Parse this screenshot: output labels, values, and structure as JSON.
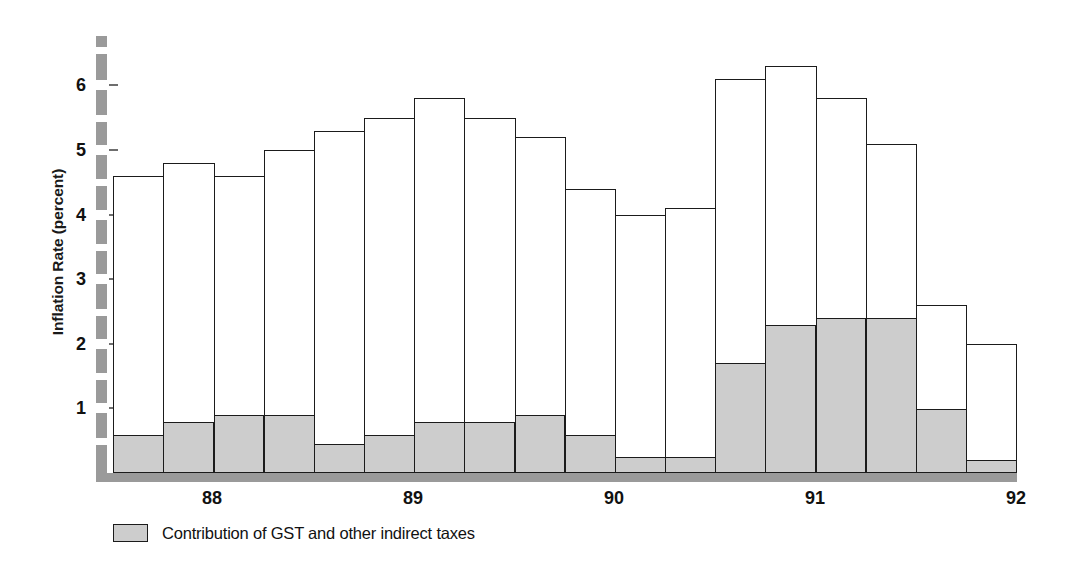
{
  "chart_data": {
    "type": "bar",
    "title": "",
    "subtitle": "",
    "xlabel": "",
    "ylabel": "Inflation Rate (percent)",
    "ylim": [
      0,
      6.75
    ],
    "yticks": [
      1,
      2,
      3,
      4,
      5,
      6
    ],
    "ytick_labels": [
      "1",
      "2",
      "3",
      "4",
      "5",
      "6"
    ],
    "xtick_labels": [
      "88",
      "89",
      "90",
      "91",
      "92"
    ],
    "xtick_positions": [
      212,
      413,
      614,
      815,
      1016
    ],
    "grid": false,
    "legend_position": "below-left",
    "stacked": true,
    "categories": [
      "1988Q1",
      "1988Q2",
      "1988Q3",
      "1988Q4",
      "1989Q1",
      "1989Q2",
      "1989Q3",
      "1989Q4",
      "1990Q1",
      "1990Q2",
      "1990Q3",
      "1990Q4",
      "1991Q1",
      "1991Q2",
      "1991Q3",
      "1991Q4",
      "1992Q1",
      "1992Q2"
    ],
    "series": [
      {
        "name": "Total inflation rate",
        "values": [
          4.6,
          4.8,
          4.6,
          5.0,
          5.3,
          5.5,
          5.8,
          5.5,
          5.2,
          4.4,
          4.0,
          4.1,
          6.1,
          6.3,
          5.8,
          5.1,
          2.6,
          2.0
        ],
        "color": "#ffffff",
        "edge_color": "#1b1b1b"
      },
      {
        "name": "Contribution of GST and other indirect taxes",
        "values": [
          0.6,
          0.8,
          0.9,
          0.9,
          0.45,
          0.6,
          0.8,
          0.8,
          0.9,
          0.6,
          0.25,
          0.25,
          1.7,
          2.3,
          2.4,
          2.4,
          1.0,
          0.2
        ],
        "color": "#cdcdcd",
        "edge_color": "#1b1b1b"
      }
    ]
  },
  "legend": {
    "swatch_color": "#cdcdcd",
    "label": "Contribution of GST and other indirect taxes"
  },
  "axis": {
    "y_title": "Inflation Rate (percent)",
    "axis_color": "#9a9a9a",
    "tick_color": "#6e6e6e"
  }
}
